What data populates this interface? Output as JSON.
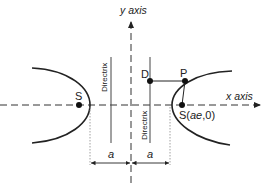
{
  "diagram": {
    "type": "hyperbola-directrix",
    "labels": {
      "y_axis": "y axis",
      "x_axis": "x axis",
      "focus_left": "S",
      "focus_right": "S(ae,0)",
      "focus_right_prefix": "S(",
      "focus_right_ae": "ae",
      "focus_right_suffix": ",0)",
      "point_d": "D",
      "point_p": "P",
      "directrix_left": "Directrix",
      "directrix_right": "Directrix",
      "dim_left": "a",
      "dim_right": "a"
    },
    "colors": {
      "line": "#222222",
      "axis": "#333333",
      "dotted": "#888888"
    }
  }
}
